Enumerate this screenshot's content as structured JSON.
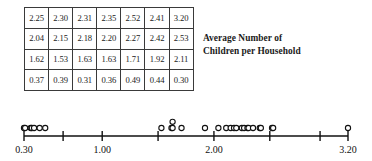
{
  "table": {
    "caption_line_1": "Average Number of",
    "caption_line_2": "Children per Household",
    "rows": [
      [
        "2.25",
        "2.30",
        "2.31",
        "2.35",
        "2.52",
        "2.41",
        "3.20"
      ],
      [
        "2.04",
        "2.15",
        "2.18",
        "2.20",
        "2.27",
        "2.42",
        "2.53"
      ],
      [
        "1.62",
        "1.53",
        "1.63",
        "1.63",
        "1.71",
        "1.92",
        "2.11"
      ],
      [
        "0.37",
        "0.39",
        "0.31",
        "0.36",
        "0.49",
        "0.44",
        "0.30"
      ]
    ]
  },
  "chart_data": {
    "type": "scatter",
    "title": "Average Number of Children per Household",
    "xlabel": "",
    "ylabel": "",
    "xlim": [
      0.3,
      3.2
    ],
    "grid": false,
    "legend": null,
    "tick_labels": [
      "0.30",
      "1.00",
      "2.00",
      "3.20"
    ],
    "labeled_ticks": [
      0.3,
      1.0,
      2.0,
      3.2
    ],
    "unlabeled_ticks": [
      0.65,
      1.5,
      2.5,
      2.95
    ],
    "values": [
      0.3,
      0.31,
      0.36,
      0.37,
      0.39,
      0.44,
      0.49,
      1.53,
      1.62,
      1.63,
      1.63,
      1.71,
      1.92,
      2.04,
      2.11,
      2.15,
      2.18,
      2.2,
      2.25,
      2.27,
      2.3,
      2.31,
      2.35,
      2.41,
      2.42,
      2.52,
      2.53,
      3.2
    ],
    "axis_colors": {
      "line": "#111111",
      "dot_stroke": "#111111",
      "dot_fill": "#ffffff"
    }
  }
}
